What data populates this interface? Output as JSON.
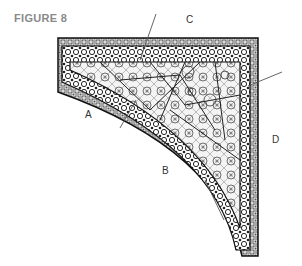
{
  "figure": {
    "title": "FIGURE 8",
    "labels": [
      {
        "id": "A",
        "text": "A"
      },
      {
        "id": "B",
        "text": "B"
      },
      {
        "id": "C",
        "text": "C"
      },
      {
        "id": "D",
        "text": "D"
      }
    ],
    "colors": {
      "ink": "#222222",
      "title": "#8a8a8a",
      "background": "#ffffff"
    }
  }
}
